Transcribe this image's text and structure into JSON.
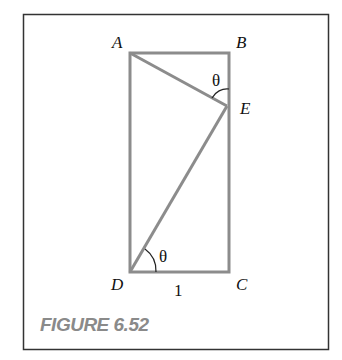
{
  "figure": {
    "caption": "FIGURE 6.52",
    "points": {
      "A": {
        "label": "A"
      },
      "B": {
        "label": "B"
      },
      "C": {
        "label": "C"
      },
      "D": {
        "label": "D"
      },
      "E": {
        "label": "E"
      }
    },
    "angle_labels": {
      "at_E": "θ",
      "at_D": "θ"
    },
    "side_label_DC": "1",
    "colors": {
      "frame": "#333333",
      "shape": "#8c8c8c",
      "caption": "#8a8a8a"
    }
  }
}
